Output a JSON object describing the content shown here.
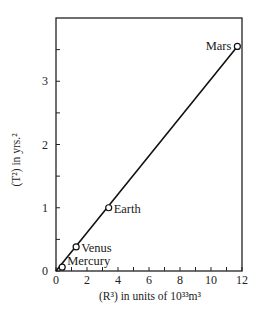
{
  "chart_data": {
    "type": "line",
    "title": "",
    "xlabel": "(R³) in units of 10³³m³",
    "ylabel": "(T²) in yrs.²",
    "xlim": [
      0,
      12
    ],
    "ylim": [
      0,
      4
    ],
    "grid": false,
    "legend": null,
    "x_ticks": [
      0,
      2,
      4,
      6,
      8,
      10,
      12
    ],
    "y_ticks": [
      0,
      1,
      2,
      3
    ],
    "x_minor_step": 1,
    "y_minor_step": 0.5,
    "series": [
      {
        "name": "Planets",
        "marker": "open-circle",
        "points": [
          {
            "label": "Mercury",
            "x": 0.4,
            "y": 0.06
          },
          {
            "label": "Venus",
            "x": 1.3,
            "y": 0.38
          },
          {
            "label": "Earth",
            "x": 3.4,
            "y": 1.0
          },
          {
            "label": "Mars",
            "x": 11.7,
            "y": 3.55
          }
        ]
      }
    ],
    "fit_line": {
      "from": [
        0,
        0
      ],
      "to": [
        11.7,
        3.55
      ]
    }
  },
  "axes": {
    "x_title": "(R³) in units of 10³³m³",
    "y_title": "(T²) in yrs.²"
  }
}
